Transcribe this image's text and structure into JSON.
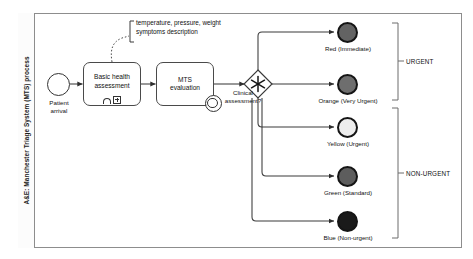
{
  "diagram": {
    "type": "bpmn-process",
    "pool_label": "A&E: Manchester Triage System (MTS) process"
  },
  "start_event": {
    "name": "start-event",
    "label_line1": "Patient",
    "label_line2": "arrival"
  },
  "tasks": [
    {
      "id": "basic-health-assessment",
      "label_line1": "Basic health",
      "label_line2": "assessment",
      "markers": [
        "manual-task-icon",
        "subprocess-plus-icon"
      ]
    },
    {
      "id": "mts-evaluation",
      "label_line1": "MTS",
      "label_line2": "evaluation",
      "boundary_event": "timer-icon"
    }
  ],
  "gateway": {
    "id": "clinical-assessment-gateway",
    "kind": "complex-gateway-asterisk",
    "label_line1": "Clinical",
    "label_line2": "assessment?"
  },
  "annotation": {
    "line1": "temperature, pressure, weight",
    "line2": "symptoms description"
  },
  "end_events": [
    {
      "id": "red",
      "label": "Red (Immediate)",
      "fill": "#636363"
    },
    {
      "id": "orange",
      "label": "Orange (Very Urgent)",
      "fill": "#6e6e6e"
    },
    {
      "id": "yellow",
      "label": "Yellow (Urgent)",
      "fill": "#ededed"
    },
    {
      "id": "green",
      "label": "Green (Standard)",
      "fill": "#5d5d5d"
    },
    {
      "id": "blue",
      "label": "Blue (Non-urgent)",
      "fill": "#1a1a1a"
    }
  ],
  "groups": [
    {
      "id": "urgent",
      "label": "URGENT"
    },
    {
      "id": "non-urgent",
      "label": "NON-URGENT"
    }
  ],
  "colors": {
    "stroke": "#3a3a3a",
    "pool_border": "#8d8d8d",
    "text": "#111111"
  }
}
